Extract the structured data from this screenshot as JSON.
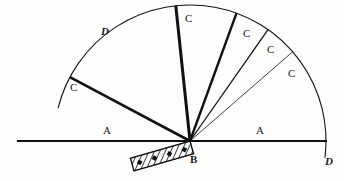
{
  "figure": {
    "background_color": "#fdfdfc",
    "ink_color": "#111111",
    "canvas": {
      "width": 344,
      "height": 181
    }
  },
  "geometry": {
    "pivot": {
      "x": 190,
      "y": 141
    },
    "baseline": {
      "x1": 18,
      "y1": 141,
      "x2": 326,
      "y2": 141
    },
    "arc": {
      "center_x": 190,
      "center_y": 141,
      "radius": 136,
      "start_angle_deg": 166,
      "end_angle_deg": -7
    }
  },
  "labels": {
    "arc_left": "D",
    "arc_right": "D",
    "baseline_left": "A",
    "baseline_right": "A",
    "magnet": "B",
    "rays": [
      "C",
      "C",
      "C",
      "C",
      "C"
    ]
  },
  "rays": [
    {
      "name": "ray-1",
      "label": "C",
      "angle_deg": 152,
      "stroke_width": 2.6,
      "label_x": 70,
      "label_y": 82
    },
    {
      "name": "ray-2",
      "label": "C",
      "angle_deg": 96,
      "stroke_width": 3.0,
      "label_x": 185,
      "label_y": 13
    },
    {
      "name": "ray-3",
      "label": "C",
      "angle_deg": 70,
      "stroke_width": 2.4,
      "label_x": 243,
      "label_y": 28
    },
    {
      "name": "ray-4",
      "label": "C",
      "angle_deg": 55,
      "stroke_width": 1.3,
      "label_x": 267,
      "label_y": 44
    },
    {
      "name": "ray-5",
      "label": "C",
      "angle_deg": 41,
      "stroke_width": 0.8,
      "label_x": 288,
      "label_y": 68
    }
  ],
  "label_positions": {
    "arc_left_d": {
      "x": 101,
      "y": 26
    },
    "arc_right_d": {
      "x": 325,
      "y": 156
    },
    "baseline_left_a": {
      "x": 103,
      "y": 125
    },
    "baseline_right_a": {
      "x": 256,
      "y": 125
    },
    "magnet_b": {
      "x": 190,
      "y": 154
    }
  },
  "magnet": {
    "name": "bar-magnet",
    "center_x": 162,
    "center_y": 156,
    "length": 62,
    "thickness": 13,
    "tilt_deg": -16,
    "fill": "hatched",
    "pole_dots": 4
  }
}
